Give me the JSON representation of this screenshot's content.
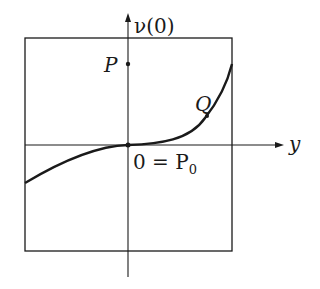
{
  "diagram": {
    "vertical_axis_label": "ν(0)",
    "horizontal_axis_label": "y",
    "point_p_label": "P",
    "point_q_label": "Q",
    "origin_label_prefix": "0 = P",
    "origin_label_subscript": "0",
    "colors": {
      "ink": "#1a1a1a",
      "background": "#ffffff"
    }
  }
}
